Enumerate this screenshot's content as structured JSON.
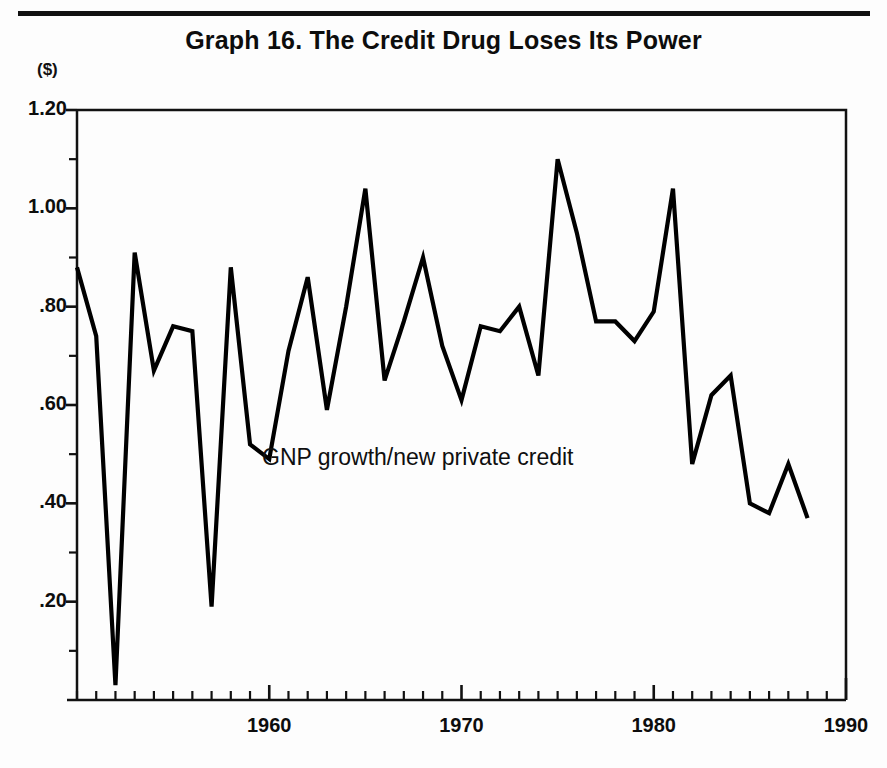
{
  "figure": {
    "title": "Graph 16. The Credit Drug Loses Its Power",
    "unit_label": "($)",
    "annotation": "GNP growth/new private credit",
    "rule_color": "#111111",
    "line_color": "#000000",
    "background": "#fdfdfd"
  },
  "chart_data": {
    "type": "line",
    "title": "Graph 16. The Credit Drug Loses Its Power",
    "subtitle": "",
    "xlabel": "",
    "ylabel": "($)",
    "series_name": "GNP growth/new private credit",
    "grid": false,
    "legend": "inline annotation",
    "xlim": [
      1950,
      1990
    ],
    "ylim": [
      0.0,
      1.2
    ],
    "y_ticks_major": [
      0.2,
      0.4,
      0.6,
      0.8,
      1.0,
      1.2
    ],
    "y_tick_labels": [
      ".20",
      ".40",
      ".60",
      ".80",
      "1.00",
      "1.20"
    ],
    "y_ticks_minor": [
      0.1,
      0.3,
      0.5,
      0.7,
      0.9,
      1.1
    ],
    "x_ticks_major": [
      1960,
      1970,
      1980,
      1990
    ],
    "x_tick_labels": [
      "1960",
      "1970",
      "1980",
      "1990"
    ],
    "x_ticks_minor_step": 1,
    "x": [
      1950,
      1951,
      1952,
      1953,
      1954,
      1955,
      1956,
      1957,
      1958,
      1959,
      1960,
      1961,
      1962,
      1963,
      1964,
      1965,
      1966,
      1967,
      1968,
      1969,
      1970,
      1971,
      1972,
      1973,
      1974,
      1975,
      1976,
      1977,
      1978,
      1979,
      1980,
      1981,
      1982,
      1983,
      1984,
      1985,
      1986,
      1987,
      1988
    ],
    "values": [
      0.88,
      0.74,
      0.03,
      0.91,
      0.67,
      0.76,
      0.75,
      0.19,
      0.88,
      0.52,
      0.49,
      0.71,
      0.86,
      0.59,
      0.8,
      1.04,
      0.65,
      0.77,
      0.9,
      0.72,
      0.61,
      0.76,
      0.75,
      0.8,
      0.66,
      1.1,
      0.95,
      0.77,
      0.77,
      0.73,
      0.79,
      1.04,
      0.48,
      0.62,
      0.66,
      0.4,
      0.38,
      0.48,
      0.37
    ]
  },
  "axes_geometry": {
    "left_px": 77,
    "right_px": 846,
    "top_px": 110,
    "bottom_px": 700
  }
}
